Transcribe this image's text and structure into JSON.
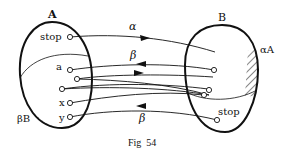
{
  "figure": {
    "caption": "Fig  54",
    "set_a": {
      "label": "A",
      "points": [
        "stop",
        "a",
        "",
        "",
        "x",
        "y"
      ],
      "shaded_region_label": "βB"
    },
    "set_b": {
      "label": "B",
      "points": [
        "stop"
      ],
      "shaded_region_label": "αA"
    },
    "arrows": [
      {
        "label": "α",
        "from": "A.stop",
        "to": "B",
        "direction": "right"
      },
      {
        "label": "β",
        "from": "B",
        "to": "A.a",
        "direction": "left"
      },
      {
        "label": "",
        "from": "A",
        "to": "B",
        "direction": "right"
      },
      {
        "label": "β",
        "from": "B.stop",
        "to": "A.y",
        "direction": "left"
      }
    ],
    "colors": {
      "ink": "#111111",
      "background": "#ffffff"
    }
  }
}
